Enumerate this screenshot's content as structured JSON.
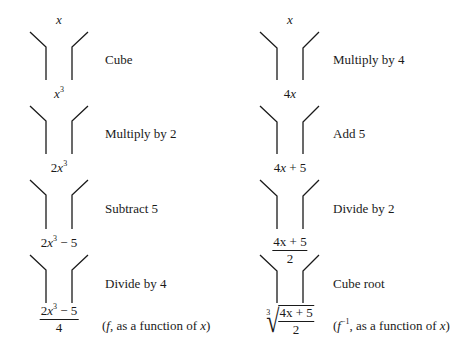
{
  "diagram": {
    "type": "function-machine-flow",
    "left_column": {
      "input": "x",
      "steps": [
        {
          "operation": "Cube",
          "result": "x^3"
        },
        {
          "operation": "Multiply by 2",
          "result": "2x^3"
        },
        {
          "operation": "Subtract 5",
          "result": "2x^3 − 5"
        },
        {
          "operation": "Divide by 4",
          "result": "(2x^3 − 5)/4"
        }
      ],
      "output_note": "(f, as a function of x)"
    },
    "right_column": {
      "input": "x",
      "steps": [
        {
          "operation": "Multiply by 4",
          "result": "4x"
        },
        {
          "operation": "Add 5",
          "result": "4x + 5"
        },
        {
          "operation": "Divide by 2",
          "result": "(4x + 5)/2"
        },
        {
          "operation": "Cube root",
          "result": "∛((4x + 5)/2)"
        }
      ],
      "output_note": "(f⁻¹, as a function of x)"
    }
  },
  "labels": {
    "left": {
      "x": "x",
      "x3_base": "x",
      "x3_exp": "3",
      "two_x3_coef": "2",
      "two_x3_base": "x",
      "two_x3_exp": "3",
      "sub_coef": "2",
      "sub_base": "x",
      "sub_exp": "3",
      "sub_rest": " − 5",
      "frac_coef": "2",
      "frac_base": "x",
      "frac_exp": "3",
      "frac_rest": " − 5",
      "frac_den": "4",
      "step1": "Cube",
      "step2": "Multiply by 2",
      "step3": "Subtract 5",
      "step4": "Divide by 4",
      "note_open": "(",
      "note_f": "f",
      "note_mid": ", as a function of ",
      "note_x": "x",
      "note_close": ")"
    },
    "right": {
      "x": "x",
      "four_x_coef": "4",
      "four_x_base": "x",
      "add_coef": "4",
      "add_base": "x",
      "add_rest": " + 5",
      "frac_coef": "4",
      "frac_base": "x",
      "frac_rest": " + 5",
      "frac_den": "2",
      "root_index": "3",
      "root_sign": "√",
      "root_coef": "4",
      "root_base": "x",
      "root_rest": " + 5",
      "root_den": "2",
      "step1": "Multiply by 4",
      "step2": "Add 5",
      "step3": "Divide by 2",
      "step4": "Cube root",
      "note_open": "(",
      "note_f": "f",
      "note_exp": "−1",
      "note_mid": ", as a function of ",
      "note_x": "x",
      "note_close": ")"
    }
  }
}
